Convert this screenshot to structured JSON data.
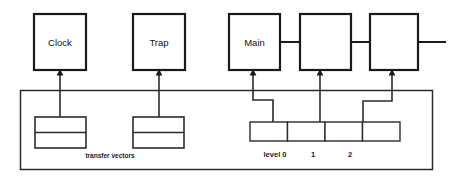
{
  "diagram": {
    "colors": {
      "stroke": "#1a1a1a",
      "thin_stroke": "#2b2b2b",
      "background": "#ffffff"
    },
    "top_nodes": [
      {
        "id": "clock",
        "label": "Clock",
        "x": 34,
        "y": 14,
        "w": 52,
        "h": 56
      },
      {
        "id": "trap",
        "label": "Trap",
        "x": 133,
        "y": 14,
        "w": 52,
        "h": 56
      },
      {
        "id": "main",
        "label": "Main",
        "x": 229,
        "y": 14,
        "w": 51,
        "h": 56
      },
      {
        "id": "node_2",
        "label": "",
        "x": 300,
        "y": 14,
        "w": 51,
        "h": 56
      },
      {
        "id": "node_3",
        "label": "",
        "x": 370,
        "y": 14,
        "w": 48,
        "h": 56
      }
    ],
    "transfer_vectors": {
      "caption": "transfer vectors",
      "boxes": [
        {
          "id": "tv_1",
          "x": 35,
          "y": 117,
          "w": 51,
          "h": 31
        },
        {
          "id": "tv_2",
          "x": 133,
          "y": 117,
          "w": 51,
          "h": 31
        }
      ]
    },
    "level_bar": {
      "x": 250,
      "y": 122,
      "w": 150,
      "h": 19,
      "cells": 4,
      "labels": [
        {
          "text": "level 0",
          "cx": 275
        },
        {
          "text": "1",
          "cx": 313
        },
        {
          "text": "2",
          "cx": 350
        }
      ]
    },
    "container": {
      "x": 20,
      "y": 90,
      "w": 412,
      "h": 80
    }
  }
}
